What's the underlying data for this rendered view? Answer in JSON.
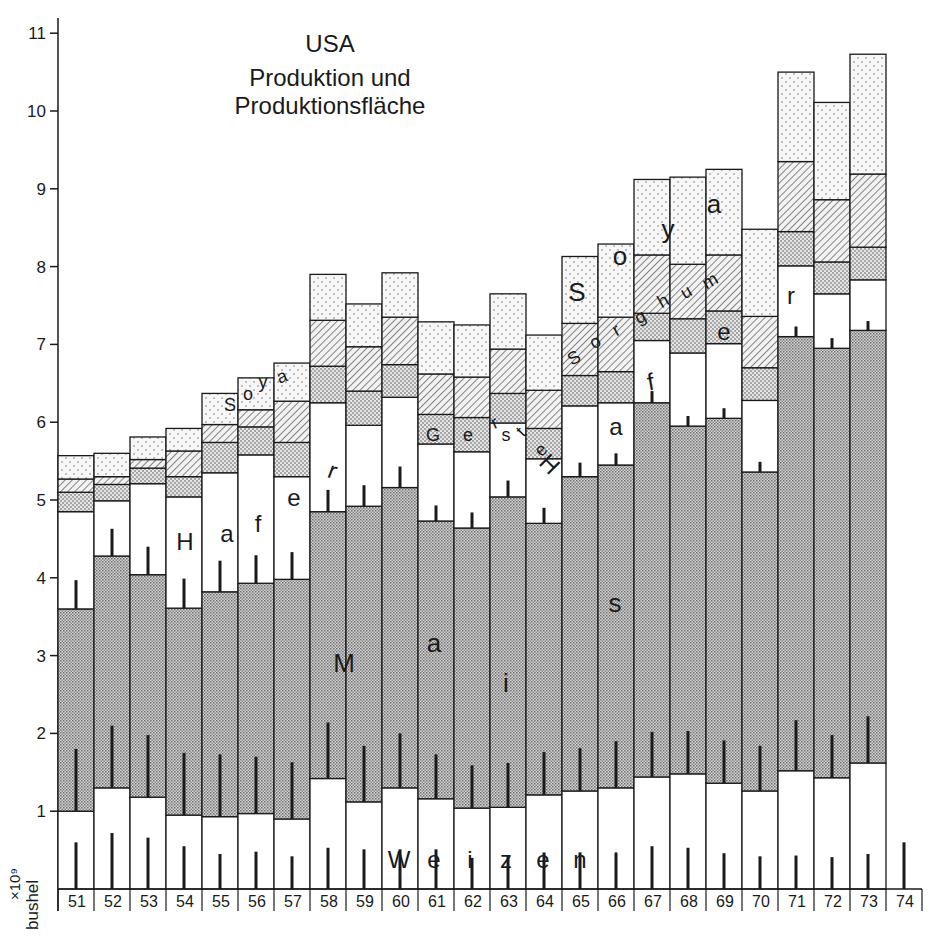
{
  "title": {
    "line1": "USA",
    "line2": "Produktion und",
    "line3": "Produktionsfläche"
  },
  "y_unit": {
    "multiplier": "×10⁹",
    "unit": "bushel"
  },
  "colors": {
    "ink": "#1a1a1a",
    "paper": "#ffffff",
    "mais_fill": "#bdbdbd",
    "gerste_fill": "#d6d6d6",
    "soya_fill": "#f1f1f1",
    "sorghum_hatch": "#555555"
  },
  "inline_labels": {
    "weizen": [
      "W",
      "e",
      "i",
      "z",
      "e",
      "n"
    ],
    "mais": [
      "M",
      "a",
      "i",
      "s"
    ],
    "hafer_left": [
      "H",
      "a",
      "f",
      "e",
      "r"
    ],
    "hafer_right": [
      "H",
      "a",
      "f",
      "e",
      "r"
    ],
    "gerste": [
      "G",
      "e",
      "r",
      "s",
      "t",
      "e"
    ],
    "sorghum": [
      "S",
      "o",
      "r",
      "g",
      "h",
      "u",
      "m"
    ],
    "soya_left": [
      "S",
      "o",
      "y",
      "a"
    ],
    "soya_right": [
      "S",
      "o",
      "y",
      "a"
    ]
  },
  "chart_data": {
    "type": "bar",
    "stacked": true,
    "title": "USA Produktion und Produktionsfläche",
    "xlabel": "",
    "ylabel": "×10⁹ bushel",
    "ylim": [
      0,
      11.3
    ],
    "yticks": [
      1,
      2,
      3,
      4,
      5,
      6,
      7,
      8,
      9,
      10,
      11
    ],
    "grid": false,
    "legend": "inline labels within bands",
    "categories": [
      "51",
      "52",
      "53",
      "54",
      "55",
      "56",
      "57",
      "58",
      "59",
      "60",
      "61",
      "62",
      "63",
      "64",
      "65",
      "66",
      "67",
      "68",
      "69",
      "70",
      "71",
      "72",
      "73",
      "74"
    ],
    "series_order_bottom_to_top": [
      "Weizen",
      "Mais",
      "Hafer",
      "Gerste",
      "Sorghum",
      "Soya"
    ],
    "cumulative_tops": {
      "Weizen": [
        1.0,
        1.3,
        1.18,
        0.95,
        0.93,
        0.97,
        0.9,
        1.42,
        1.12,
        1.3,
        1.16,
        1.04,
        1.05,
        1.21,
        1.26,
        1.3,
        1.44,
        1.48,
        1.36,
        1.26,
        1.52,
        1.43,
        1.62,
        null
      ],
      "Mais": [
        3.6,
        4.28,
        4.04,
        3.61,
        3.82,
        3.93,
        3.98,
        4.85,
        4.92,
        5.16,
        4.73,
        4.64,
        5.04,
        4.7,
        5.3,
        5.45,
        6.25,
        5.95,
        6.05,
        5.36,
        7.1,
        6.95,
        7.18,
        null
      ],
      "Hafer": [
        4.85,
        4.99,
        5.21,
        5.04,
        5.35,
        5.58,
        5.3,
        6.25,
        5.96,
        6.32,
        5.72,
        5.62,
        5.99,
        5.53,
        6.21,
        6.25,
        7.05,
        6.89,
        7.01,
        6.28,
        8.01,
        7.65,
        7.83,
        null
      ],
      "Gerste": [
        5.1,
        5.2,
        5.41,
        5.3,
        5.74,
        5.94,
        5.74,
        6.72,
        6.4,
        6.74,
        6.1,
        6.06,
        6.37,
        5.92,
        6.6,
        6.65,
        7.4,
        7.33,
        7.43,
        6.7,
        8.45,
        8.06,
        8.25,
        null
      ],
      "Sorghum": [
        5.27,
        5.3,
        5.52,
        5.63,
        5.97,
        6.16,
        6.27,
        7.31,
        6.97,
        7.35,
        6.62,
        6.58,
        6.94,
        6.41,
        7.27,
        7.35,
        8.15,
        8.03,
        8.15,
        7.36,
        9.35,
        8.86,
        9.19,
        null
      ],
      "Soya": [
        5.57,
        5.6,
        5.81,
        5.92,
        6.37,
        6.57,
        6.76,
        7.9,
        7.52,
        7.92,
        7.29,
        7.25,
        7.65,
        7.12,
        8.13,
        8.29,
        9.12,
        9.15,
        9.25,
        8.48,
        10.5,
        10.11,
        10.73,
        null
      ]
    },
    "series": [
      {
        "name": "Weizen",
        "pattern": "white",
        "values": [
          1.0,
          1.3,
          1.18,
          0.95,
          0.93,
          0.97,
          0.9,
          1.42,
          1.12,
          1.3,
          1.16,
          1.04,
          1.05,
          1.21,
          1.26,
          1.3,
          1.44,
          1.48,
          1.36,
          1.26,
          1.52,
          1.43,
          1.62,
          null
        ]
      },
      {
        "name": "Mais",
        "pattern": "dense-dots",
        "values": [
          2.6,
          2.98,
          2.86,
          2.66,
          2.89,
          2.96,
          3.08,
          3.43,
          3.8,
          3.86,
          3.57,
          3.6,
          3.99,
          3.49,
          4.04,
          4.15,
          4.81,
          4.47,
          4.69,
          4.1,
          5.58,
          5.52,
          5.56,
          null
        ]
      },
      {
        "name": "Hafer",
        "pattern": "white",
        "values": [
          1.25,
          0.71,
          1.17,
          1.43,
          1.53,
          1.65,
          1.32,
          1.4,
          1.04,
          1.16,
          0.99,
          0.98,
          0.95,
          0.83,
          0.91,
          0.8,
          0.8,
          0.94,
          0.96,
          0.92,
          0.91,
          0.7,
          0.65,
          null
        ]
      },
      {
        "name": "Gerste",
        "pattern": "medium-dots",
        "values": [
          0.25,
          0.21,
          0.2,
          0.26,
          0.39,
          0.36,
          0.44,
          0.47,
          0.44,
          0.42,
          0.38,
          0.44,
          0.38,
          0.39,
          0.39,
          0.4,
          0.35,
          0.44,
          0.42,
          0.42,
          0.44,
          0.41,
          0.42,
          null
        ]
      },
      {
        "name": "Sorghum",
        "pattern": "hatched",
        "values": [
          0.17,
          0.1,
          0.11,
          0.33,
          0.23,
          0.22,
          0.53,
          0.59,
          0.57,
          0.61,
          0.52,
          0.52,
          0.57,
          0.49,
          0.67,
          0.7,
          0.75,
          0.7,
          0.72,
          0.66,
          0.9,
          0.8,
          0.94,
          null
        ]
      },
      {
        "name": "Soya",
        "pattern": "light-dots",
        "values": [
          0.3,
          0.3,
          0.29,
          0.29,
          0.4,
          0.41,
          0.49,
          0.59,
          0.55,
          0.57,
          0.67,
          0.67,
          0.71,
          0.71,
          0.86,
          0.94,
          0.97,
          1.12,
          1.1,
          1.12,
          1.15,
          1.25,
          1.54,
          null
        ]
      }
    ],
    "area_markers_note": "Thin vertical black ticks inside each band indicate production area (Produktionsfläche); approximate lengths in axis units",
    "area_markers": {
      "Weizen": [
        0.6,
        0.72,
        0.66,
        0.55,
        0.45,
        0.48,
        0.42,
        0.53,
        0.51,
        0.51,
        0.51,
        0.4,
        0.42,
        0.47,
        0.47,
        0.47,
        0.55,
        0.53,
        0.46,
        0.42,
        0.43,
        0.41,
        0.45,
        0.6
      ],
      "Mais": [
        0.8,
        0.8,
        0.8,
        0.8,
        0.8,
        0.73,
        0.73,
        0.72,
        0.72,
        0.7,
        0.57,
        0.55,
        0.57,
        0.55,
        0.55,
        0.6,
        0.58,
        0.55,
        0.55,
        0.58,
        0.65,
        0.55,
        0.6,
        null
      ],
      "Hafer": [
        0.37,
        0.35,
        0.36,
        0.38,
        0.4,
        0.36,
        0.35,
        0.28,
        0.27,
        0.27,
        0.2,
        0.2,
        0.21,
        0.2,
        0.18,
        0.15,
        0.15,
        0.13,
        0.13,
        0.13,
        0.13,
        0.13,
        0.12,
        null
      ]
    }
  }
}
